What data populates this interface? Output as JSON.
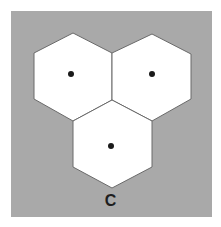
{
  "figure": {
    "label": "C",
    "colors": {
      "background": "#ffffff",
      "panel": "#a9a9a9",
      "hex_fill": "#ffffff",
      "hex_stroke": "#6a6a6a",
      "dot": "#1a1a1a"
    },
    "hexagons": [
      {
        "name": "top-left",
        "points": "73,33 112,53 112,100 73,121 34,99 34,53",
        "dot": {
          "cx": 71,
          "cy": 74,
          "r": 3
        }
      },
      {
        "name": "top-right",
        "points": "152,34 191,54 191,99 152,121 112,100 112,53",
        "dot": {
          "cx": 152,
          "cy": 74,
          "r": 3
        }
      },
      {
        "name": "bottom",
        "points": "112,100 152,121 152,167 112,188 73,167 73,121",
        "dot": {
          "cx": 111,
          "cy": 146,
          "r": 3
        }
      }
    ]
  }
}
